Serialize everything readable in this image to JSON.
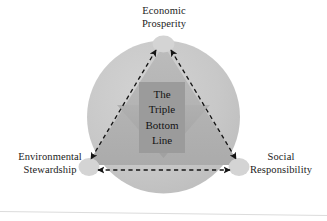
{
  "diagram": {
    "title_lines": [
      "The",
      "Triple",
      "Bottom",
      "Line"
    ],
    "center_label": "The Triple Bottom Line",
    "vertices": [
      {
        "id": "economic",
        "label_lines": [
          "Economic",
          "Prosperity"
        ],
        "label": "Economic Prosperity",
        "position": "top"
      },
      {
        "id": "environmental",
        "label_lines": [
          "Environmental",
          "Stewardship"
        ],
        "label": "Environmental Stewardship",
        "position": "bottom-left"
      },
      {
        "id": "social",
        "label_lines": [
          "Social",
          "Responsibility"
        ],
        "label": "Social Responsibility",
        "position": "bottom-right"
      }
    ],
    "connectors": [
      {
        "id": "economic-environmental",
        "style": "dashed",
        "arrowheads": "both"
      },
      {
        "id": "economic-social",
        "style": "dashed",
        "arrowheads": "both"
      },
      {
        "id": "environmental-social",
        "style": "dashed",
        "arrowheads": "both"
      }
    ],
    "shapes": {
      "circle": "background-circle",
      "triangle_up": "upward-triangle",
      "triangle_down": "downward-triangle",
      "center_rectangle": "center-box"
    },
    "colors": {
      "background": "#ffffff",
      "circle_fill": "#c8c8c8",
      "triangle_up_fill": "#b4b4b4",
      "triangle_down_fill": "#a8a8a8",
      "center_box_fill": "#9b9b9b",
      "vertex_node_fill": "#d2d2d2",
      "connector_stroke": "#1a1a1a",
      "text": "#1b1b1b"
    }
  }
}
